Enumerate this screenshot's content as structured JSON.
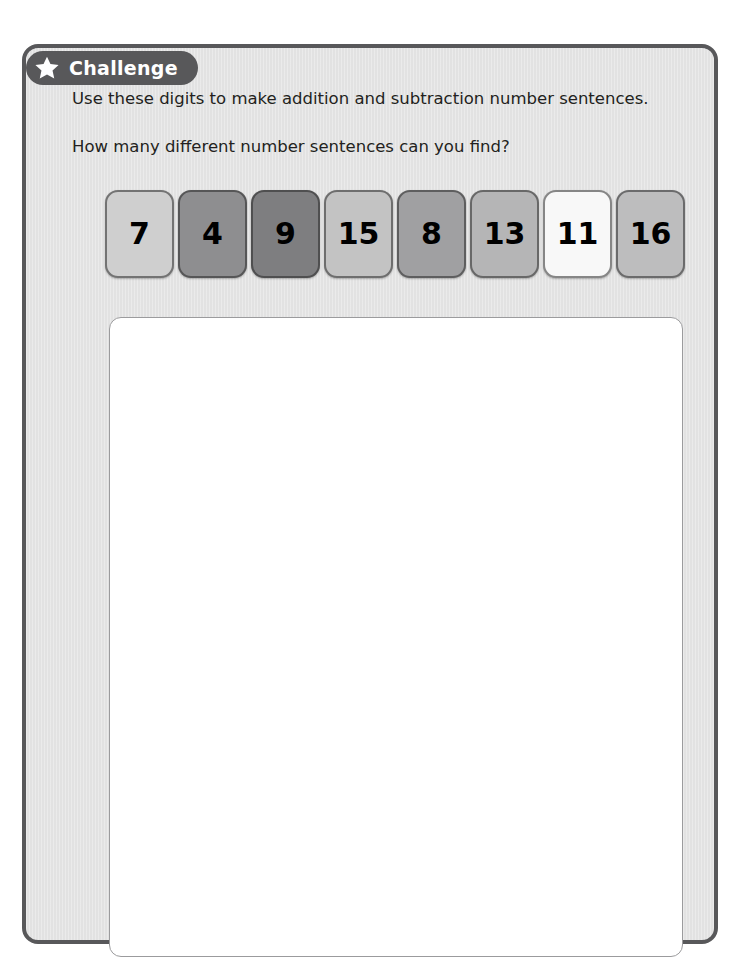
{
  "badge": {
    "label": "Challenge",
    "icon": "star-icon",
    "background_color": "#58585a",
    "text_color": "#ffffff"
  },
  "instructions": {
    "line_1": "Use these digits to make addition and subtraction number sentences.",
    "line_2": "How many different number sentences can you find?"
  },
  "digit_cards": [
    {
      "value": "7",
      "color": "#cfcfcf"
    },
    {
      "value": "4",
      "color": "#8e8e90"
    },
    {
      "value": "9",
      "color": "#7e7e80"
    },
    {
      "value": "15",
      "color": "#c3c3c3"
    },
    {
      "value": "8",
      "color": "#a0a0a2"
    },
    {
      "value": "13",
      "color": "#b5b5b6"
    },
    {
      "value": "11",
      "color": "#f8f8f8"
    },
    {
      "value": "16",
      "color": "#bdbdbe"
    }
  ],
  "answer_box": {
    "content": "",
    "background_color": "#ffffff",
    "border_color": "#9b9b9d"
  },
  "frame": {
    "background_color": "#e2e2e2",
    "border_color": "#58585a"
  }
}
